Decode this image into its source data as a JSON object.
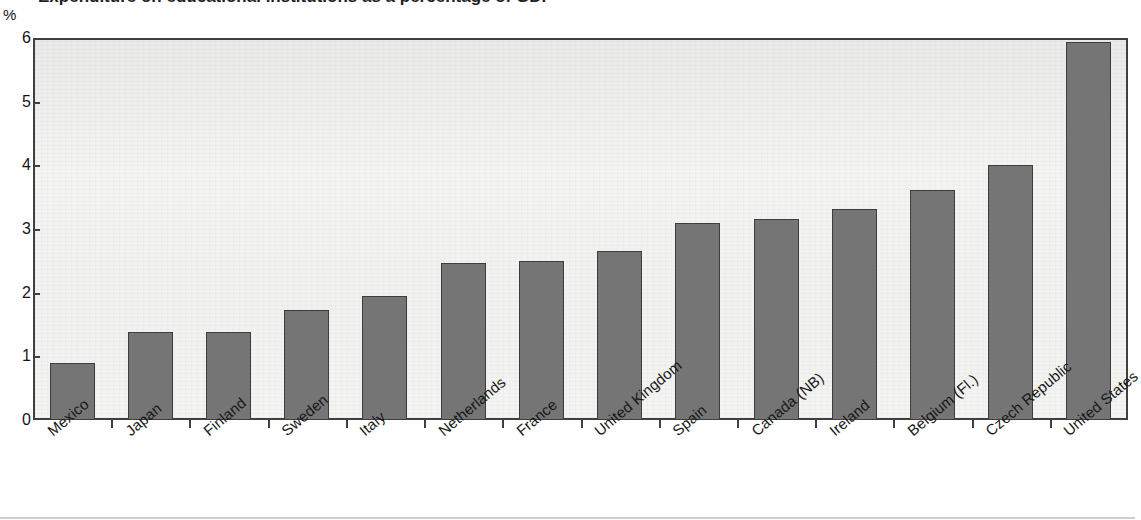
{
  "figure": {
    "unit_label": "%",
    "clipped_title": "Expenditure on educational institutions as a percentage of GDP"
  },
  "chart_data": {
    "type": "bar",
    "title": "",
    "xlabel": "",
    "ylabel": "%",
    "ylim": [
      0,
      6
    ],
    "yticks": [
      "0",
      "1",
      "2",
      "3",
      "4",
      "5",
      "6"
    ],
    "grid": false,
    "legend": "none",
    "bar_color": "#757575",
    "bar_border_color": "#3d3d3d",
    "plot_background": "#f3f3f2",
    "axis_color": "#404040",
    "categories": [
      "Mexico",
      "Japan",
      "Finland",
      "Sweden",
      "Italy",
      "Netherlands",
      "France",
      "United Kingdom",
      "Spain",
      "Canada (NB)",
      "Ireland",
      "Belgium (Fl.)",
      "Czech Republic",
      "United States"
    ],
    "values": [
      0.9,
      1.38,
      1.39,
      1.73,
      1.95,
      2.46,
      2.49,
      2.65,
      3.09,
      3.15,
      3.31,
      3.61,
      4.01,
      5.93
    ]
  }
}
